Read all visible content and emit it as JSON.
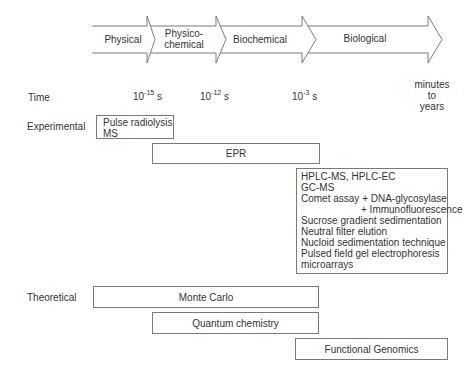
{
  "stages": [
    {
      "label_line1": "Physical",
      "label_line2": ""
    },
    {
      "label_line1": "Physico-",
      "label_line2": "chemical"
    },
    {
      "label_line1": "Biochemical",
      "label_line2": ""
    },
    {
      "label_line1": "Biological",
      "label_line2": ""
    }
  ],
  "row_labels": {
    "time": "Time",
    "experimental": "Experimental",
    "theoretical": "Theoretical"
  },
  "time_marks": [
    {
      "base": "10",
      "exp": "-15",
      "unit": " s"
    },
    {
      "base": "10",
      "exp": "-12",
      "unit": " s"
    },
    {
      "base": "10",
      "exp": "-3",
      "unit": " s"
    },
    {
      "line1": "minutes",
      "line2": "to",
      "line3": "years"
    }
  ],
  "experimental": {
    "pulse_box": [
      "Pulse radiolysis",
      "MS"
    ],
    "epr_box": "EPR",
    "biological_box": [
      "HPLC-MS, HPLC-EC",
      "GC-MS",
      "Comet assay + DNA-glycosylase",
      "+ Immunofluorescence",
      "Sucrose gradient sedimentation",
      "Neutral filter elution",
      "Nucloid sedimentation technique",
      "Pulsed field gel electrophoresis",
      "microarrays"
    ]
  },
  "theoretical": {
    "monte_carlo": "Monte Carlo",
    "quantum": "Quantum chemistry",
    "genomics": "Functional Genomics"
  },
  "colors": {
    "stroke": "#7a7a7a",
    "text": "#333333",
    "background": "#ffffff"
  }
}
